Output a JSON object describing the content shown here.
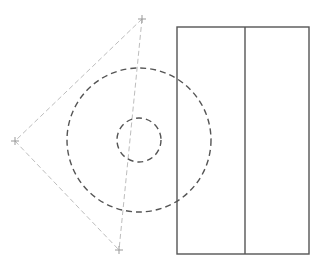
{
  "canvas": {
    "width": 321,
    "height": 268,
    "background": "#ffffff"
  },
  "colors": {
    "construction": "#bdbdbd",
    "marker": "#999999",
    "circle": "#555555",
    "rect": "#555555"
  },
  "markers": [
    {
      "id": "top",
      "x": 142,
      "y": 19
    },
    {
      "id": "left",
      "x": 15,
      "y": 141
    },
    {
      "id": "bottom",
      "x": 119,
      "y": 250
    }
  ],
  "circles": [
    {
      "id": "outer",
      "cx": 139,
      "cy": 140,
      "r": 72
    },
    {
      "id": "inner",
      "cx": 139,
      "cy": 140,
      "r": 22
    }
  ],
  "rectangle": {
    "x": 177,
    "y": 27,
    "width": 132,
    "height": 227,
    "divider_x": 245
  }
}
